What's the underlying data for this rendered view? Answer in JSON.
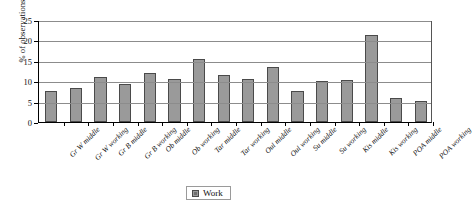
{
  "chart_data": {
    "type": "bar",
    "title": "",
    "xlabel": "",
    "ylabel": "% of observations",
    "ylim": [
      0,
      25
    ],
    "yticks": [
      0,
      5,
      10,
      15,
      20,
      25
    ],
    "grid": true,
    "legend_position": "bottom-center",
    "categories": [
      "Gr W middle",
      "Gr W working",
      "Gr B middle",
      "Gr B working",
      "Ob middle",
      "Ob working",
      "Tar middle",
      "Tar working",
      "Oul middle",
      "Oul working",
      "Su middle",
      "Su working",
      "Kis middle",
      "Kis working",
      "POA middle",
      "POA working"
    ],
    "series": [
      {
        "name": "Work",
        "color": "#9a9a9a",
        "values": [
          7.5,
          8.4,
          11.0,
          9.4,
          11.9,
          10.5,
          15.5,
          11.6,
          10.6,
          13.6,
          7.5,
          10.1,
          10.2,
          21.3,
          5.9,
          5.1
        ]
      }
    ]
  },
  "legend": {
    "items": [
      {
        "label": "Work",
        "color": "#9a9a9a"
      }
    ]
  },
  "axis": {
    "y_title": "% of observations"
  }
}
